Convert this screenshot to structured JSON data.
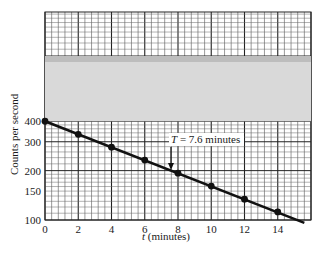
{
  "chart_data": {
    "type": "line",
    "scale": "semi-log",
    "title": "",
    "xlabel": "t (minutes)",
    "ylabel": "Counts per second",
    "x_ticks": [
      0,
      2,
      4,
      6,
      8,
      10,
      12,
      14
    ],
    "y_ticks": [
      100,
      150,
      200,
      300,
      400
    ],
    "xlim": [
      0,
      16
    ],
    "ylim_log": [
      100,
      1800
    ],
    "grid": true,
    "series": [
      {
        "name": "Measured counts",
        "x": [
          0,
          2,
          4,
          6,
          8,
          10,
          12,
          14
        ],
        "values": [
          400,
          333,
          278,
          232,
          193,
          161,
          134,
          112
        ]
      }
    ],
    "fit_line": {
      "start": [
        0,
        400
      ],
      "end": [
        15.6,
        96
      ]
    },
    "annotations": [
      {
        "text": "T = 7.6 minutes",
        "arrow_to_x": 7.6
      }
    ]
  },
  "labels": {
    "xlabel_t": "t",
    "xlabel_rest": " (minutes)",
    "ylabel": "Counts per second",
    "annotation_T": "T",
    "annotation_rest": " = 7.6 minutes"
  }
}
